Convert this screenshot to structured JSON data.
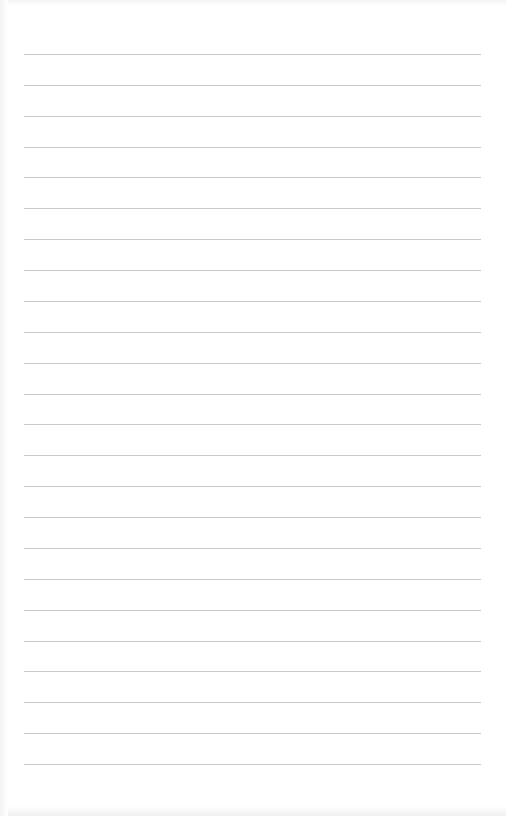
{
  "document": {
    "type": "lined-paper",
    "background_color": "#ffffff",
    "line_color": "#c9c9c9",
    "line_count": 24,
    "first_line_y": 54,
    "line_spacing": 30.87,
    "line_left": 24,
    "line_right": 481,
    "text_lines": []
  }
}
